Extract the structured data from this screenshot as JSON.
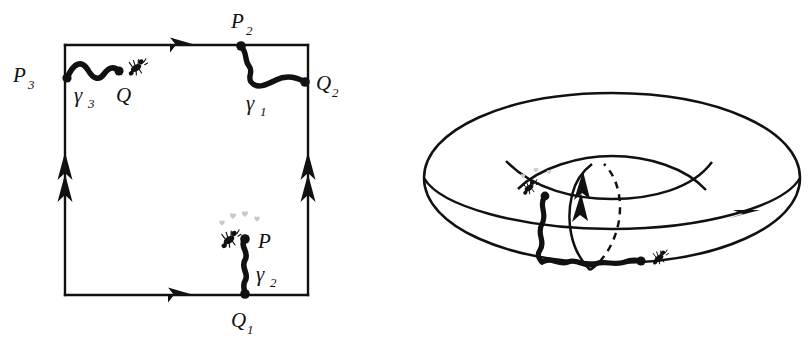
{
  "figure": {
    "background_color": "#ffffff",
    "ink_color": "#111111",
    "heart_color": "#c8c8c8"
  },
  "square_diagram": {
    "name": "fundamental-polygon",
    "edges": [
      {
        "id": "top",
        "arrow_count": 1,
        "direction": "right",
        "label": "a"
      },
      {
        "id": "bottom",
        "arrow_count": 1,
        "direction": "right",
        "label": "a"
      },
      {
        "id": "left",
        "arrow_count": 2,
        "direction": "up",
        "label": "b"
      },
      {
        "id": "right",
        "arrow_count": 2,
        "direction": "up",
        "label": "b"
      }
    ],
    "vertex_labels": [
      {
        "id": "P2",
        "text": "P",
        "subscript": "2"
      },
      {
        "id": "Q2",
        "text": "Q",
        "subscript": "2"
      },
      {
        "id": "P3",
        "text": "P",
        "subscript": "3"
      },
      {
        "id": "Q",
        "text": "Q",
        "subscript": ""
      },
      {
        "id": "P",
        "text": "P",
        "subscript": ""
      },
      {
        "id": "Q1",
        "text": "Q",
        "subscript": "1"
      }
    ],
    "path_labels": [
      {
        "id": "gamma1",
        "text": "γ",
        "subscript": "1"
      },
      {
        "id": "gamma2",
        "text": "γ",
        "subscript": "2"
      },
      {
        "id": "gamma3",
        "text": "γ",
        "subscript": "3"
      }
    ],
    "ants": [
      {
        "id": "ant-top-left",
        "hearts": 0
      },
      {
        "id": "ant-bottom-right",
        "hearts": 4
      }
    ]
  },
  "torus_diagram": {
    "name": "torus",
    "features": [
      {
        "id": "outer-silhouette",
        "style": "solid"
      },
      {
        "id": "inner-hole",
        "style": "solid"
      },
      {
        "id": "equator-curve",
        "style": "solid",
        "arrow_count": 1,
        "direction": "right"
      },
      {
        "id": "meridian-front",
        "style": "solid",
        "arrow_count": 2,
        "direction": "up"
      },
      {
        "id": "meridian-back",
        "style": "dashed"
      }
    ],
    "ants": [
      {
        "id": "ant-upper",
        "hearts": 3
      },
      {
        "id": "ant-lower",
        "hearts": 0
      }
    ]
  }
}
